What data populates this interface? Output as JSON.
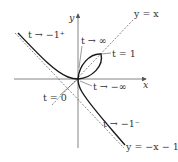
{
  "diagram": {
    "axes": {
      "x_label": "x",
      "y_label": "y"
    },
    "lines": {
      "identity": "y = x",
      "asymptote": "y = −x − 1"
    },
    "annotations": {
      "t_to_neg1_plus": "t → −1⁺",
      "t_to_inf": "t → ∞",
      "t_eq_1": "t = 1",
      "t_to_neg_inf": "t → −∞",
      "t_eq_0": "t = 0",
      "t_to_neg1_minus": "t → −1⁻"
    },
    "colors": {
      "curve": "#1a1a1a",
      "axes": "#555555",
      "dashed": "#555555",
      "text": "#333333"
    }
  }
}
